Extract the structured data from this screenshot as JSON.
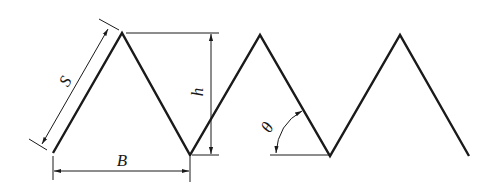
{
  "diagram": {
    "labels": {
      "slant_length": "S",
      "height": "h",
      "base_width": "B",
      "angle": "θ"
    },
    "colors": {
      "stroke": "#1a1a1a",
      "background": "#ffffff"
    }
  }
}
